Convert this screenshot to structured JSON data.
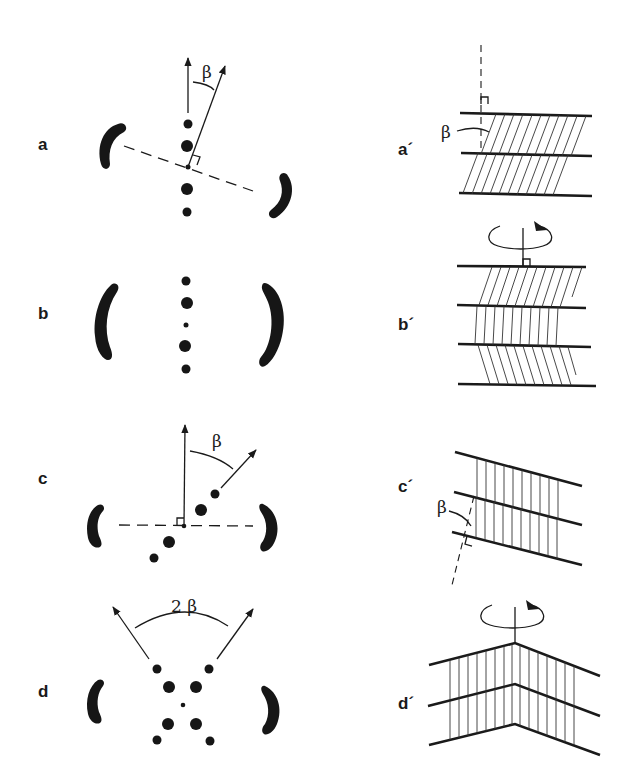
{
  "figure": {
    "panels": [
      {
        "id": "a",
        "label": "a",
        "angle_label": "β",
        "description": "tilted diffraction pattern"
      },
      {
        "id": "b",
        "label": "b",
        "description": "untilted diffraction pattern"
      },
      {
        "id": "c",
        "label": "c",
        "angle_label": "β",
        "description": "off-axis layer line pattern"
      },
      {
        "id": "d",
        "label": "d",
        "angle_label": "2 β",
        "description": "cross pattern"
      },
      {
        "id": "a_prime",
        "label": "a´",
        "angle_label": "β",
        "description": "tilted lamellae"
      },
      {
        "id": "b_prime",
        "label": "b´",
        "description": "chevron lamellae with rotation axis"
      },
      {
        "id": "c_prime",
        "label": "c´",
        "angle_label": "β",
        "description": "inclined lamellae"
      },
      {
        "id": "d_prime",
        "label": "d´",
        "description": "roof-shaped lamellae with rotation axis"
      }
    ]
  }
}
